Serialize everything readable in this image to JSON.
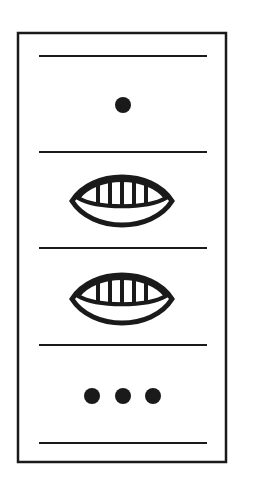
{
  "diagram": {
    "title": "",
    "colors": {
      "ink": "#1a1a1a",
      "background": "#ffffff"
    },
    "levels": [
      {
        "position": 1,
        "glyph": "dot",
        "count": 1
      },
      {
        "position": 2,
        "glyph": "shell",
        "count": 1
      },
      {
        "position": 3,
        "glyph": "shell",
        "count": 1
      },
      {
        "position": 4,
        "glyph": "dot",
        "count": 3
      }
    ]
  }
}
